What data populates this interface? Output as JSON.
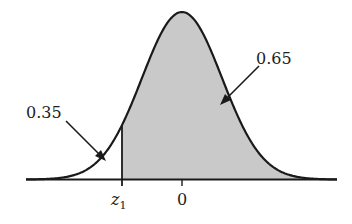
{
  "chart_data": {
    "type": "area",
    "title": "",
    "distribution": {
      "mean": 0,
      "sd": 1
    },
    "x_ticks": [
      "z1",
      "0"
    ],
    "z1_value": -0.385,
    "regions": [
      {
        "name": "left-tail",
        "label": "0.35",
        "shaded": false,
        "range": [
          "-inf",
          "z1"
        ]
      },
      {
        "name": "right-area",
        "label": "0.65",
        "shaded": true,
        "range": [
          "z1",
          "+inf"
        ]
      }
    ],
    "xlabel": "",
    "ylabel": "",
    "grid": false,
    "legend": null,
    "colors": {
      "curve": "#1a1a1a",
      "fill": "#c9c9c9",
      "background": "#ffffff"
    }
  },
  "labels": {
    "left_area": "0.35",
    "right_area": "0.65",
    "z_tick_var": "z",
    "z_tick_sub": "1",
    "zero_tick": "0"
  }
}
